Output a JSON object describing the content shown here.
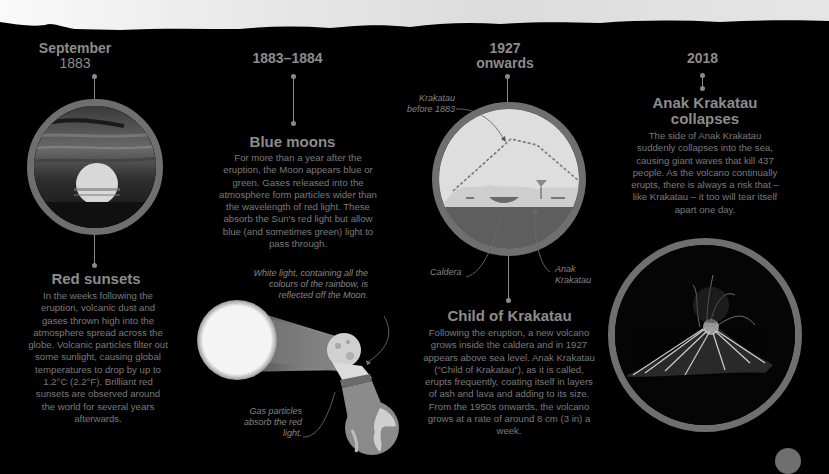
{
  "header": {
    "sky_image": "volcanic-skyline-silhouette"
  },
  "timeline": [
    {
      "date_main": "September",
      "date_sub": "1883",
      "title": "Red sunsets",
      "body": "In the weeks following the eruption, volcanic dust and gases thrown high into the atmosphere spread across the globe. Volcanic particles filter out some sunlight, causing global temperatures to drop by up to 1.2°C (2.2°F). Brilliant red sunsets are observed around the world for several years afterwards.",
      "image": "red-sunset-photo"
    },
    {
      "date_main": "1883–1884",
      "date_sub": "",
      "title": "Blue moons",
      "body": "For more than a year after the eruption, the Moon appears blue or green. Gases released into the atmosphere form particles wider than the wavelength of red light. These absorb the Sun's red light but allow blue (and sometimes green) light to pass through.",
      "annotations": {
        "white_light": "White light, containing all the colours of the rainbow, is reflected off the Moon.",
        "gas_particles": "Gas particles absorb the red light."
      },
      "image": "sun-moon-earth-diagram"
    },
    {
      "date_main": "1927",
      "date_sub": "onwards",
      "title": "Child of Krakatau",
      "body": "Following the eruption, a new volcano grows inside the caldera and in 1927 appears above sea level. Anak Krakatau (\"Child of Krakatau\"), as it is called, erupts frequently, coating itself in layers of ash and lava and adding to its size. From the 1950s onwards, the volcano grows at a rate of around 8 cm (3 in) a week.",
      "annotations": {
        "before": "Krakatau before 1883",
        "caldera": "Caldera",
        "anak": "Anak Krakatau"
      },
      "image": "caldera-cross-section-diagram"
    },
    {
      "date_main": "2018",
      "date_sub": "",
      "title": "Anak Krakatau collapses",
      "body": "The side of Anak Krakatau suddenly collapses into the sea, causing giant waves that kill 437 people. As the volcano continually erupts, there is always a risk that – like Krakatau – it too will tear itself apart one day.",
      "image": "erupting-volcano-night-photo"
    }
  ],
  "colors": {
    "background": "#000000",
    "ring": "#6f6f6f",
    "text": "#8a8a8a"
  }
}
